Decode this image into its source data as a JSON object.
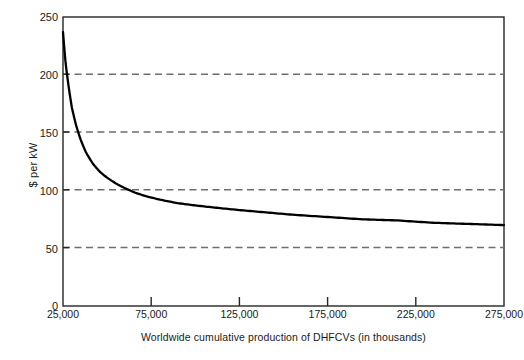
{
  "chart_data": {
    "type": "line",
    "title": "",
    "subtitle": "",
    "xlabel": "Worldwide cumulative production of DHFCVs (in thousands)",
    "ylabel": "$ per kW",
    "xlim": [
      25000,
      275000
    ],
    "ylim": [
      0,
      250
    ],
    "xticks": [
      25000,
      75000,
      125000,
      175000,
      225000,
      275000
    ],
    "xtick_labels": [
      "25,000",
      "75,000",
      "125,000",
      "175,000",
      "225,000",
      "275,000"
    ],
    "yticks": [
      0,
      50,
      100,
      150,
      200,
      250
    ],
    "ytick_labels": [
      "0",
      "50",
      "100",
      "150",
      "200",
      "250"
    ],
    "grid": "horizontal-dashed",
    "gridlines_at": [
      50,
      100,
      150,
      200
    ],
    "legend": "none",
    "line_color": "#000000",
    "grid_color": "#777777",
    "axis_color": "#1a1a1a",
    "background": "#ffffff",
    "series": [
      {
        "name": "Fuel cell system cost",
        "x": [
          25000,
          26500,
          28000,
          30000,
          32500,
          35000,
          38000,
          42000,
          46000,
          50000,
          55000,
          60000,
          66000,
          72000,
          80000,
          90000,
          100000,
          112000,
          125000,
          140000,
          155000,
          175000,
          195000,
          215000,
          235000,
          255000,
          275000
        ],
        "values": [
          237,
          210,
          192,
          172,
          156,
          144,
          133,
          123,
          116,
          111,
          106,
          102,
          98,
          95,
          92,
          89,
          87,
          85,
          83,
          81,
          79,
          77,
          75,
          74,
          72,
          71,
          70
        ]
      }
    ],
    "annotations": []
  },
  "figure": {
    "y_axis_title": "$ per kW",
    "x_axis_title": "Worldwide cumulative production of DHFCVs (in thousands)"
  }
}
